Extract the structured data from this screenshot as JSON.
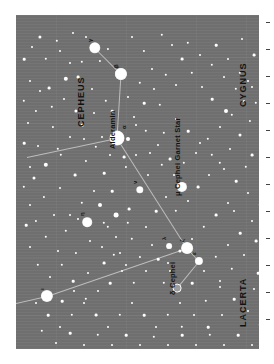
{
  "chart_data": {
    "type": "scatter",
    "xlabel": "",
    "ylabel": "",
    "orientation_degrees": 90,
    "background_color": "#6f6f6f",
    "star_color": "#ffffff",
    "line_color": "#c9c9c9",
    "constellations": [
      {
        "name": "CEPHEUS",
        "x": 60,
        "y": 112
      },
      {
        "name": "CYGNUS",
        "x": 222,
        "y": 92
      },
      {
        "name": "LACERTA",
        "x": 222,
        "y": 312
      }
    ],
    "named_stars": [
      {
        "label": "Alderamin",
        "greek": "α",
        "x": 101,
        "y": 123,
        "r": 7.0
      },
      {
        "label": "Garnet Star",
        "greek": "μ",
        "secondary": "μ Cephei",
        "x": 166,
        "y": 172,
        "r": 4.6
      },
      {
        "label": "δ Cephei",
        "greek": "δ",
        "x": 161,
        "y": 273,
        "r": 3.4,
        "double": true
      }
    ],
    "greek_stars": [
      {
        "greek": "γ",
        "x": 79,
        "y": 33,
        "r": 5.2
      },
      {
        "greek": "ι",
        "x": 105,
        "y": 59,
        "r": 5.6
      },
      {
        "greek": "β",
        "x": 105,
        "y": 59,
        "r": 5.6
      },
      {
        "greek": "η",
        "x": 71,
        "y": 207,
        "r": 4.3
      },
      {
        "greek": "ν",
        "x": 124,
        "y": 175,
        "r": 3.2
      },
      {
        "greek": "λ",
        "x": 153,
        "y": 231,
        "r": 2.4
      },
      {
        "greek": "ζ",
        "x": 171,
        "y": 233,
        "r": 5.4
      },
      {
        "greek": "ε",
        "x": 183,
        "y": 246,
        "r": 3.6
      },
      {
        "greek": "ι",
        "x": 31,
        "y": 281,
        "r": 5.6
      },
      {
        "greek": "β",
        "x": 258,
        "y": 297,
        "r": 4.6
      }
    ],
    "constellation_lines": [
      {
        "from": [
          79,
          33
        ],
        "to": [
          105,
          59
        ]
      },
      {
        "from": [
          105,
          59
        ],
        "to": [
          101,
          123
        ]
      },
      {
        "from": [
          101,
          123
        ],
        "to": [
          11,
          142
        ]
      },
      {
        "from": [
          101,
          123
        ],
        "to": [
          171,
          233
        ]
      },
      {
        "from": [
          171,
          233
        ],
        "to": [
          183,
          246
        ]
      },
      {
        "from": [
          183,
          246
        ],
        "to": [
          161,
          273
        ]
      },
      {
        "from": [
          171,
          233
        ],
        "to": [
          31,
          281
        ]
      },
      {
        "from": [
          31,
          281
        ],
        "to": [
          0,
          288
        ]
      }
    ],
    "field_stars": [
      [
        24,
        22,
        1.6
      ],
      [
        41,
        26,
        1.2
      ],
      [
        57,
        18,
        1.0
      ],
      [
        66,
        47,
        1.2
      ],
      [
        50,
        64,
        2.2
      ],
      [
        33,
        73,
        1.4
      ],
      [
        20,
        96,
        1.1
      ],
      [
        37,
        112,
        1.1
      ],
      [
        22,
        131,
        1.0
      ],
      [
        30,
        150,
        2.2
      ],
      [
        45,
        140,
        1.2
      ],
      [
        18,
        163,
        1.5
      ],
      [
        28,
        182,
        1.1
      ],
      [
        44,
        173,
        1.0
      ],
      [
        59,
        160,
        1.4
      ],
      [
        70,
        146,
        1.1
      ],
      [
        88,
        158,
        1.3
      ],
      [
        96,
        176,
        1.3
      ],
      [
        84,
        190,
        2.0
      ],
      [
        100,
        200,
        2.4
      ],
      [
        113,
        194,
        1.4
      ],
      [
        92,
        212,
        1.2
      ],
      [
        74,
        226,
        1.0
      ],
      [
        60,
        238,
        1.1
      ],
      [
        46,
        250,
        1.2
      ],
      [
        57,
        266,
        1.3
      ],
      [
        72,
        258,
        1.0
      ],
      [
        88,
        248,
        1.4
      ],
      [
        104,
        238,
        1.0
      ],
      [
        116,
        224,
        1.2
      ],
      [
        130,
        212,
        1.0
      ],
      [
        140,
        196,
        1.3
      ],
      [
        150,
        182,
        1.0
      ],
      [
        160,
        196,
        1.2
      ],
      [
        172,
        186,
        1.0
      ],
      [
        182,
        172,
        1.4
      ],
      [
        193,
        160,
        1.0
      ],
      [
        204,
        148,
        1.2
      ],
      [
        214,
        134,
        1.0
      ],
      [
        224,
        120,
        1.5
      ],
      [
        234,
        106,
        1.1
      ],
      [
        210,
        96,
        2.0
      ],
      [
        196,
        84,
        1.3
      ],
      [
        186,
        72,
        1.0
      ],
      [
        176,
        58,
        1.2
      ],
      [
        166,
        44,
        1.4
      ],
      [
        156,
        30,
        1.0
      ],
      [
        146,
        20,
        1.2
      ],
      [
        200,
        30,
        1.3
      ],
      [
        212,
        44,
        1.0
      ],
      [
        224,
        58,
        1.2
      ],
      [
        236,
        72,
        1.0
      ],
      [
        238,
        40,
        1.4
      ],
      [
        226,
        24,
        1.0
      ],
      [
        150,
        60,
        1.2
      ],
      [
        138,
        74,
        1.0
      ],
      [
        128,
        88,
        1.3
      ],
      [
        118,
        102,
        1.0
      ],
      [
        130,
        116,
        1.2
      ],
      [
        142,
        130,
        1.0
      ],
      [
        154,
        144,
        1.4
      ],
      [
        120,
        140,
        1.0
      ],
      [
        110,
        152,
        1.1
      ],
      [
        132,
        160,
        1.0
      ],
      [
        148,
        118,
        1.2
      ],
      [
        160,
        104,
        1.0
      ],
      [
        172,
        116,
        1.3
      ],
      [
        184,
        128,
        1.0
      ],
      [
        196,
        140,
        1.2
      ],
      [
        208,
        154,
        1.0
      ],
      [
        220,
        166,
        1.3
      ],
      [
        232,
        178,
        1.0
      ],
      [
        244,
        190,
        1.2
      ],
      [
        236,
        206,
        1.0
      ],
      [
        224,
        218,
        1.3
      ],
      [
        212,
        230,
        1.0
      ],
      [
        200,
        242,
        1.2
      ],
      [
        188,
        256,
        1.0
      ],
      [
        176,
        268,
        1.3
      ],
      [
        164,
        288,
        1.0
      ],
      [
        152,
        300,
        1.2
      ],
      [
        140,
        312,
        1.0
      ],
      [
        128,
        300,
        1.3
      ],
      [
        116,
        288,
        1.0
      ],
      [
        104,
        300,
        1.2
      ],
      [
        92,
        312,
        1.0
      ],
      [
        80,
        300,
        1.4
      ],
      [
        68,
        288,
        1.0
      ],
      [
        56,
        300,
        1.2
      ],
      [
        44,
        312,
        1.0
      ],
      [
        32,
        300,
        1.3
      ],
      [
        20,
        288,
        1.0
      ],
      [
        26,
        316,
        1.2
      ],
      [
        40,
        328,
        1.0
      ],
      [
        54,
        318,
        1.3
      ],
      [
        68,
        330,
        1.0
      ],
      [
        82,
        320,
        1.2
      ],
      [
        96,
        330,
        1.0
      ],
      [
        110,
        320,
        1.3
      ],
      [
        124,
        330,
        1.0
      ],
      [
        138,
        322,
        1.2
      ],
      [
        152,
        330,
        1.0
      ],
      [
        166,
        320,
        1.3
      ],
      [
        180,
        330,
        1.0
      ],
      [
        194,
        320,
        1.2
      ],
      [
        208,
        330,
        1.0
      ],
      [
        222,
        320,
        1.3
      ],
      [
        236,
        330,
        1.0
      ],
      [
        244,
        310,
        1.2
      ],
      [
        232,
        296,
        1.0
      ],
      [
        218,
        284,
        1.3
      ],
      [
        204,
        272,
        1.0
      ],
      [
        190,
        286,
        1.2
      ],
      [
        206,
        300,
        1.0
      ],
      [
        192,
        312,
        1.3
      ],
      [
        178,
        300,
        1.0
      ],
      [
        166,
        312,
        1.2
      ],
      [
        154,
        256,
        1.0
      ],
      [
        142,
        244,
        1.3
      ],
      [
        130,
        256,
        1.0
      ],
      [
        118,
        268,
        1.2
      ],
      [
        106,
        256,
        1.0
      ],
      [
        94,
        268,
        1.3
      ],
      [
        82,
        276,
        1.0
      ],
      [
        70,
        284,
        1.2
      ],
      [
        58,
        276,
        1.0
      ],
      [
        46,
        286,
        1.3
      ],
      [
        34,
        262,
        1.0
      ],
      [
        22,
        250,
        1.2
      ],
      [
        14,
        232,
        1.0
      ],
      [
        10,
        210,
        1.3
      ],
      [
        14,
        190,
        1.0
      ],
      [
        8,
        172,
        1.2
      ],
      [
        14,
        152,
        1.0
      ],
      [
        8,
        128,
        1.3
      ],
      [
        12,
        108,
        1.0
      ],
      [
        8,
        86,
        1.2
      ],
      [
        14,
        66,
        1.0
      ],
      [
        8,
        44,
        1.3
      ],
      [
        16,
        32,
        1.0
      ],
      [
        30,
        44,
        1.2
      ],
      [
        44,
        36,
        1.0
      ],
      [
        62,
        62,
        1.4
      ],
      [
        76,
        74,
        1.0
      ],
      [
        90,
        86,
        1.2
      ],
      [
        78,
        98,
        1.0
      ],
      [
        66,
        110,
        1.3
      ],
      [
        54,
        122,
        1.0
      ],
      [
        42,
        134,
        1.2
      ],
      [
        86,
        122,
        1.0
      ],
      [
        96,
        96,
        1.3
      ],
      [
        112,
        82,
        1.0
      ],
      [
        124,
        68,
        1.2
      ],
      [
        136,
        54,
        1.0
      ],
      [
        112,
        124,
        2.0
      ],
      [
        120,
        110,
        1.0
      ],
      [
        108,
        142,
        1.4
      ],
      [
        94,
        140,
        1.0
      ],
      [
        80,
        132,
        1.2
      ],
      [
        68,
        124,
        1.0
      ],
      [
        60,
        96,
        1.6
      ],
      [
        48,
        84,
        1.0
      ],
      [
        36,
        92,
        1.2
      ],
      [
        24,
        76,
        1.0
      ],
      [
        200,
        200,
        1.4
      ],
      [
        212,
        188,
        1.0
      ],
      [
        188,
        212,
        1.2
      ],
      [
        176,
        224,
        1.0
      ],
      [
        164,
        236,
        1.6
      ],
      [
        152,
        248,
        1.0
      ],
      [
        236,
        140,
        1.4
      ],
      [
        244,
        158,
        1.0
      ],
      [
        230,
        152,
        1.2
      ],
      [
        218,
        196,
        1.0
      ],
      [
        240,
        226,
        1.4
      ],
      [
        228,
        240,
        1.0
      ],
      [
        216,
        254,
        1.2
      ],
      [
        204,
        266,
        1.0
      ],
      [
        242,
        258,
        1.3
      ],
      [
        238,
        274,
        1.0
      ],
      [
        110,
        250,
        1.0
      ],
      [
        98,
        240,
        1.2
      ],
      [
        86,
        232,
        1.0
      ],
      [
        124,
        242,
        1.1
      ],
      [
        136,
        230,
        1.0
      ],
      [
        148,
        268,
        1.2
      ],
      [
        54,
        200,
        1.0
      ],
      [
        66,
        188,
        1.2
      ],
      [
        78,
        176,
        1.0
      ],
      [
        88,
        208,
        1.2
      ],
      [
        100,
        222,
        1.0
      ],
      [
        112,
        208,
        1.2
      ],
      [
        38,
        200,
        1.0
      ],
      [
        50,
        216,
        1.2
      ],
      [
        62,
        204,
        1.0
      ],
      [
        30,
        222,
        1.2
      ],
      [
        42,
        236,
        1.0
      ],
      [
        20,
        206,
        1.1
      ],
      [
        158,
        160,
        1.0
      ],
      [
        146,
        150,
        1.2
      ],
      [
        134,
        138,
        1.0
      ],
      [
        168,
        148,
        1.2
      ],
      [
        180,
        138,
        1.0
      ],
      [
        192,
        124,
        1.2
      ],
      [
        204,
        112,
        1.0
      ],
      [
        216,
        100,
        1.2
      ],
      [
        228,
        86,
        1.0
      ],
      [
        240,
        88,
        1.2
      ],
      [
        232,
        66,
        1.0
      ],
      [
        220,
        74,
        1.2
      ],
      [
        208,
        62,
        1.0
      ],
      [
        196,
        50,
        1.2
      ],
      [
        184,
        40,
        1.0
      ],
      [
        172,
        28,
        1.2
      ],
      [
        160,
        70,
        1.0
      ],
      [
        144,
        90,
        1.2
      ],
      [
        128,
        36,
        1.1
      ],
      [
        116,
        22,
        1.0
      ],
      [
        92,
        34,
        1.1
      ],
      [
        70,
        22,
        1.0
      ],
      [
        84,
        46,
        1.1
      ],
      [
        54,
        48,
        1.0
      ]
    ],
    "axis_ticks_right": 12
  }
}
